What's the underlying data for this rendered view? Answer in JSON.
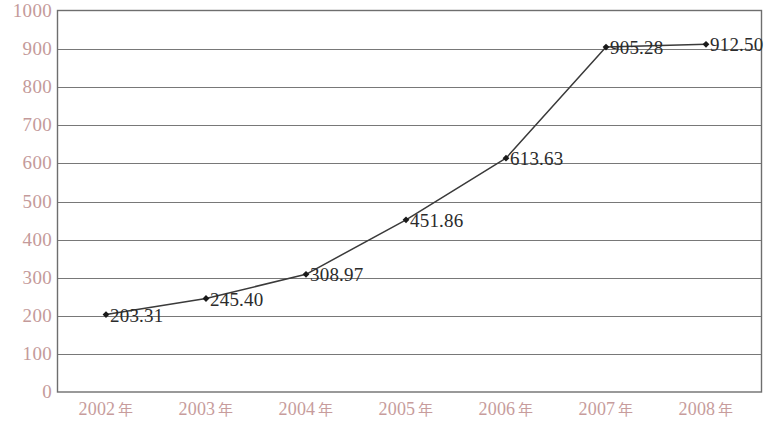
{
  "chart_data": {
    "type": "line",
    "title": "",
    "subtitle": "",
    "xlabel": "",
    "ylabel": "",
    "categories": [
      "2002 年",
      "2003 年",
      "2004 年",
      "2005 年",
      "2006 年",
      "2007 年",
      "2008 年"
    ],
    "values": [
      203.31,
      245.4,
      308.97,
      451.86,
      613.63,
      905.28,
      912.5
    ],
    "point_labels": [
      "203.31",
      "245.40",
      "308.97",
      "451.86",
      "613.63",
      "905.28",
      "912.50"
    ],
    "series": [
      {
        "name": "",
        "values": [
          203.31,
          245.4,
          308.97,
          451.86,
          613.63,
          905.28,
          912.5
        ]
      }
    ],
    "ylim": [
      0,
      1000
    ],
    "ytick_step": 100,
    "ytick_labels": [
      "1000",
      "900",
      "800",
      "700",
      "600",
      "500",
      "400",
      "300",
      "200",
      "100",
      "0"
    ],
    "ytick_values": [
      1000,
      900,
      800,
      700,
      600,
      500,
      400,
      300,
      200,
      100,
      0
    ],
    "grid": true,
    "grid_axis": "y",
    "legend": false,
    "legend_position": "none",
    "marker": "diamond",
    "colors": {
      "axis_text": "#c49a9a",
      "x_axis_text": "#c79c9c",
      "line": "#3a3a3a",
      "marker": "#1a1a1a",
      "gridline": "#787878",
      "frame": "#6e6e6e",
      "data_label": "#2b2b2b",
      "background": "#ffffff"
    }
  }
}
